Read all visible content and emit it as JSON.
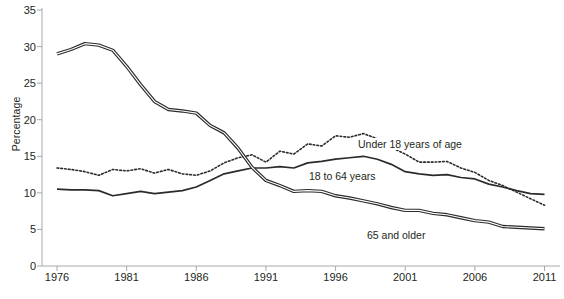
{
  "chart_data": {
    "type": "line",
    "title": "",
    "xlabel": "",
    "ylabel": "Percentage",
    "xlim": [
      1976,
      2011
    ],
    "ylim": [
      0,
      35
    ],
    "grid": false,
    "legend_position": "inline-annotations",
    "xticks": [
      1976,
      1981,
      1986,
      1991,
      1996,
      2001,
      2006,
      2011
    ],
    "yticks": [
      0,
      5,
      10,
      15,
      20,
      25,
      30,
      35
    ],
    "x": [
      1976,
      1977,
      1978,
      1979,
      1980,
      1981,
      1982,
      1983,
      1984,
      1985,
      1986,
      1987,
      1988,
      1989,
      1990,
      1991,
      1992,
      1993,
      1994,
      1995,
      1996,
      1997,
      1998,
      1999,
      2000,
      2001,
      2002,
      2003,
      2004,
      2005,
      2006,
      2007,
      2008,
      2009,
      2010,
      2011
    ],
    "series": [
      {
        "name": "Under 18 years of age",
        "style": "dotted",
        "values": [
          13.4,
          13.2,
          12.9,
          12.4,
          13.2,
          13.0,
          13.3,
          12.7,
          13.2,
          12.6,
          12.4,
          13.0,
          14.1,
          14.8,
          15.2,
          14.2,
          15.7,
          15.3,
          16.7,
          16.4,
          17.8,
          17.6,
          18.1,
          17.4,
          16.2,
          15.3,
          14.2,
          14.2,
          14.3,
          13.4,
          12.8,
          11.7,
          11.0,
          10.1,
          9.2,
          8.3
        ]
      },
      {
        "name": "18 to 64 years",
        "style": "solid",
        "values": [
          10.5,
          10.4,
          10.4,
          10.3,
          9.6,
          9.9,
          10.2,
          9.9,
          10.1,
          10.3,
          10.8,
          11.7,
          12.6,
          13.0,
          13.4,
          13.4,
          13.6,
          13.4,
          14.1,
          14.3,
          14.6,
          14.8,
          15.0,
          14.6,
          13.9,
          12.9,
          12.6,
          12.4,
          12.5,
          12.1,
          11.9,
          11.2,
          10.8,
          10.3,
          9.9,
          9.8
        ]
      },
      {
        "name": "65 and older",
        "style": "double",
        "values": [
          29.0,
          29.6,
          30.4,
          30.2,
          29.5,
          27.3,
          24.8,
          22.5,
          21.4,
          21.2,
          20.9,
          19.2,
          18.2,
          16.1,
          13.5,
          11.7,
          11.0,
          10.2,
          10.3,
          10.2,
          9.6,
          9.3,
          8.9,
          8.5,
          8.0,
          7.6,
          7.6,
          7.2,
          7.0,
          6.6,
          6.2,
          6.0,
          5.4,
          5.3,
          5.2,
          5.1
        ]
      }
    ],
    "annotations": [
      {
        "text": "Under 18 years of age",
        "x_px": 356,
        "y_px": 145
      },
      {
        "text": "18 to 64 years",
        "x_px": 307,
        "y_px": 177
      },
      {
        "text": "65 and older",
        "x_px": 365,
        "y_px": 236
      }
    ]
  },
  "axis": {
    "ylabel": "Percentage",
    "ytick_labels": [
      "35",
      "30",
      "25",
      "20",
      "15",
      "10",
      "5",
      "0"
    ],
    "xtick_labels": [
      "1976",
      "1981",
      "1986",
      "1991",
      "1996",
      "2001",
      "2006",
      "2011"
    ]
  },
  "colors": {
    "line": "#2d2a2b",
    "axis": "#a7a9ac",
    "text": "#231f20",
    "background": "#ffffff"
  }
}
